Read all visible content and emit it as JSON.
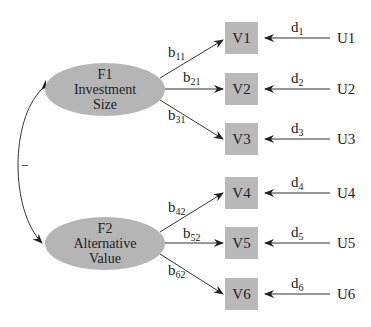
{
  "factors": [
    {
      "id": "F1",
      "line1": "F1",
      "line2": "Investment",
      "line3": "Size"
    },
    {
      "id": "F2",
      "line1": "F2",
      "line2": "Alternative",
      "line3": "Value"
    }
  ],
  "variables": [
    {
      "label": "V1",
      "loading_base": "b",
      "loading_sub": "11",
      "error_base": "d",
      "error_sub": "1",
      "unique": "U1"
    },
    {
      "label": "V2",
      "loading_base": "b",
      "loading_sub": "21",
      "error_base": "d",
      "error_sub": "2",
      "unique": "U2"
    },
    {
      "label": "V3",
      "loading_base": "b",
      "loading_sub": "31",
      "error_base": "d",
      "error_sub": "3",
      "unique": "U3"
    },
    {
      "label": "V4",
      "loading_base": "b",
      "loading_sub": "42",
      "error_base": "d",
      "error_sub": "4",
      "unique": "U4"
    },
    {
      "label": "V5",
      "loading_base": "b",
      "loading_sub": "52",
      "error_base": "d",
      "error_sub": "5",
      "unique": "U5"
    },
    {
      "label": "V6",
      "loading_base": "b",
      "loading_sub": "62",
      "error_base": "d",
      "error_sub": "6",
      "unique": "U6"
    }
  ],
  "correlation_label": "–",
  "colors": {
    "node_fill": "#b9b9b9",
    "factor_fill": "#b5b5b5",
    "line": "#333333"
  }
}
